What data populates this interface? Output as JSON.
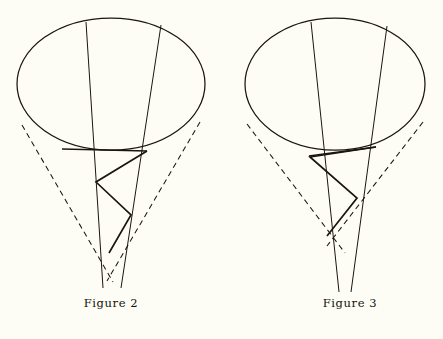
{
  "page": {
    "background_color": "#fdfdf6",
    "ink_color": "#1a160f",
    "width": 443,
    "height": 339,
    "kind": "line-drawing-geometry-figures"
  },
  "figures": [
    {
      "id": "figure-2",
      "caption": "Figure 2",
      "caption_number": "2",
      "description": "Cone with elliptical base rim, two straight generator lines, two dashed tangent lines, and an inscribed zigzag geodesic polyline",
      "ellipse": {
        "cx": 111,
        "cy": 84,
        "rx": 94,
        "ry": 66
      },
      "generators": [
        {
          "name": "generator-left",
          "x1": 86,
          "y1": 22,
          "x2": 103,
          "y2": 288
        },
        {
          "name": "generator-right",
          "x1": 161,
          "y1": 25,
          "x2": 121,
          "y2": 288
        }
      ],
      "dashed_tangents": [
        {
          "name": "dashed-left",
          "x1": 22,
          "y1": 125,
          "x2": 113,
          "y2": 282
        },
        {
          "name": "dashed-right",
          "x1": 200,
          "y1": 122,
          "x2": 107,
          "y2": 281
        }
      ],
      "chord": {
        "name": "base-chord",
        "x1": 62,
        "y1": 149,
        "x2": 147,
        "y2": 151
      },
      "zigzag": {
        "name": "zigzag-polyline",
        "points": "147,151 96,182 131,215 109,253"
      }
    },
    {
      "id": "figure-3",
      "caption": "Figure 3",
      "caption_number": "3",
      "description": "Cone with elliptical base rim, two straight generator lines, two dashed tangent lines, and an inscribed zigzag geodesic polyline with a shallower first segment",
      "ellipse": {
        "cx": 114,
        "cy": 84,
        "rx": 90,
        "ry": 66
      },
      "generators": [
        {
          "name": "generator-left",
          "x1": 90,
          "y1": 22,
          "x2": 118,
          "y2": 292
        },
        {
          "name": "generator-right",
          "x1": 166,
          "y1": 26,
          "x2": 130,
          "y2": 292
        }
      ],
      "dashed_tangents": [
        {
          "name": "dashed-left",
          "x1": 26,
          "y1": 124,
          "x2": 124,
          "y2": 253
        },
        {
          "name": "dashed-right",
          "x1": 202,
          "y1": 122,
          "x2": 106,
          "y2": 246
        }
      ],
      "chord": {
        "name": "base-chord",
        "x1": 88,
        "y1": 156,
        "x2": 155,
        "y2": 147
      },
      "zigzag": {
        "name": "zigzag-polyline",
        "points": "155,147 89,157 136,198 106,236"
      }
    }
  ]
}
